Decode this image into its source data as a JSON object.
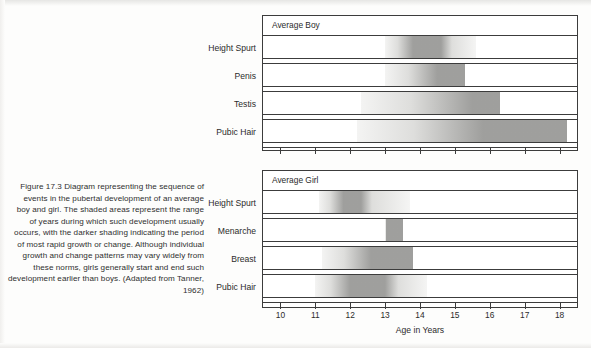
{
  "caption": {
    "text": "Figure 17.3 Diagram representing the sequence of events in the pubertal development of an average boy and girl. The shaded areas represent the range of years during which such development usually occurs, with the darker shading indicating the period of most rapid growth or change. Although individual growth and change patterns may vary widely from these norms, girls generally start and end such development earlier than boys. (Adapted from Tanner, 1962)"
  },
  "chart_data": {
    "type": "bar",
    "title": "Figure 17.3 Diagram representing the sequence of events in the pubertal development of an average boy and girl",
    "xlabel": "Age in Years",
    "ylabel": "",
    "xlim": [
      9.5,
      18.5
    ],
    "xticks": [
      10,
      11,
      12,
      13,
      14,
      15,
      16,
      17,
      18
    ],
    "xtick_labels": [
      "10",
      "11",
      "12",
      "13",
      "14",
      "15",
      "16",
      "17",
      "18"
    ],
    "grid": false,
    "legend": null,
    "panels": [
      {
        "panel_title": "Average Boy",
        "categories": [
          "Height Spurt",
          "Penis",
          "Testis",
          "Pubic Hair"
        ],
        "ranges": [
          {
            "event": "Height Spurt",
            "start": 13.0,
            "end": 15.6,
            "peak_start": 13.8,
            "peak_end": 14.6
          },
          {
            "event": "Penis",
            "start": 13.0,
            "end": 15.3,
            "peak_start": 14.5,
            "peak_end": 15.3
          },
          {
            "event": "Testis",
            "start": 12.3,
            "end": 16.3,
            "peak_start": 15.5,
            "peak_end": 16.3
          },
          {
            "event": "Pubic Hair",
            "start": 12.2,
            "end": 18.2,
            "peak_start": 15.8,
            "peak_end": 18.2
          }
        ]
      },
      {
        "panel_title": "Average Girl",
        "categories": [
          "Height Spurt",
          "Menarche",
          "Breast",
          "Pubic Hair"
        ],
        "ranges": [
          {
            "event": "Height Spurt",
            "start": 11.1,
            "end": 13.7,
            "peak_start": 11.8,
            "peak_end": 12.3
          },
          {
            "event": "Menarche",
            "start": 13.0,
            "end": 13.5,
            "peak_start": 13.0,
            "peak_end": 13.5
          },
          {
            "event": "Breast",
            "start": 11.2,
            "end": 13.8,
            "peak_start": 12.6,
            "peak_end": 13.8
          },
          {
            "event": "Pubic Hair",
            "start": 11.0,
            "end": 14.2,
            "peak_start": 12.0,
            "peak_end": 13.0
          }
        ]
      }
    ]
  },
  "colors": {
    "ink": "#3c3c3c",
    "light_shade": "#dcdcda",
    "dark_shade": "#9a9a98",
    "page": "#fdfdfc"
  }
}
